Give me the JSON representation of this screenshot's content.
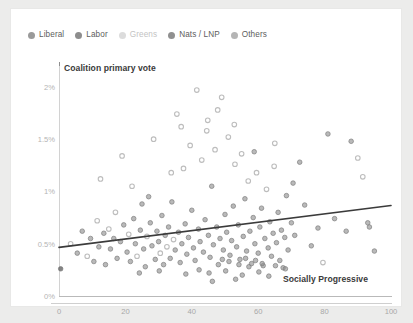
{
  "legend": {
    "items": [
      {
        "label": "Liberal",
        "color": "#9a9a9a",
        "dim": false
      },
      {
        "label": "Labor",
        "color": "#8d8d8d",
        "dim": false
      },
      {
        "label": "Greens",
        "color": "#dcdcdc",
        "dim": true
      },
      {
        "label": "Nats / LNP",
        "color": "#909090",
        "dim": false
      },
      {
        "label": "Others",
        "color": "#b5b5b5",
        "dim": false
      }
    ]
  },
  "chart_data": {
    "type": "scatter",
    "title": "",
    "xlabel": "Socially Progressive",
    "ylabel": "Coalition primary vote",
    "xlim": [
      0,
      100
    ],
    "ylim": [
      0,
      2.2
    ],
    "grid": false,
    "legend_position": "top-left",
    "xticks": [
      0,
      20,
      40,
      60,
      80,
      100
    ],
    "xtick_labels": [
      "0",
      "20",
      "40",
      "60",
      "80",
      "100"
    ],
    "yticks": [
      0,
      0.5,
      1,
      1.5,
      2
    ],
    "ytick_labels": [
      "0%",
      "0.5%",
      "1%",
      "1.5%",
      "2%"
    ],
    "marker_colors": {
      "filled": "#8e8e8e",
      "open": "#bdbdbd",
      "dark": "#6f6f6f"
    },
    "trendline": {
      "label": "linear fit",
      "color": "#3b3b3b",
      "x": [
        0,
        100
      ],
      "y": [
        0.465,
        0.865
      ]
    },
    "points": [
      {
        "x": 0.5,
        "y": 0.26,
        "s": "dark"
      },
      {
        "x": 3.5,
        "y": 0.5,
        "s": "open"
      },
      {
        "x": 5.5,
        "y": 0.41,
        "s": "filled"
      },
      {
        "x": 7.0,
        "y": 0.62,
        "s": "filled"
      },
      {
        "x": 8.5,
        "y": 0.38,
        "s": "open"
      },
      {
        "x": 9.5,
        "y": 0.55,
        "s": "filled"
      },
      {
        "x": 10.5,
        "y": 0.33,
        "s": "filled"
      },
      {
        "x": 11.5,
        "y": 0.72,
        "s": "open"
      },
      {
        "x": 12.0,
        "y": 0.47,
        "s": "filled"
      },
      {
        "x": 12.5,
        "y": 1.12,
        "s": "open"
      },
      {
        "x": 13.5,
        "y": 0.6,
        "s": "filled"
      },
      {
        "x": 14.0,
        "y": 0.3,
        "s": "filled"
      },
      {
        "x": 15.0,
        "y": 0.64,
        "s": "open"
      },
      {
        "x": 15.5,
        "y": 0.45,
        "s": "filled"
      },
      {
        "x": 16.5,
        "y": 0.55,
        "s": "filled"
      },
      {
        "x": 17.0,
        "y": 0.8,
        "s": "open"
      },
      {
        "x": 17.5,
        "y": 0.36,
        "s": "filled"
      },
      {
        "x": 18.5,
        "y": 0.52,
        "s": "filled"
      },
      {
        "x": 19.0,
        "y": 1.34,
        "s": "open"
      },
      {
        "x": 19.5,
        "y": 0.68,
        "s": "filled"
      },
      {
        "x": 20.5,
        "y": 0.42,
        "s": "filled"
      },
      {
        "x": 21.0,
        "y": 0.59,
        "s": "open"
      },
      {
        "x": 21.5,
        "y": 0.33,
        "s": "filled"
      },
      {
        "x": 22.5,
        "y": 0.74,
        "s": "filled"
      },
      {
        "x": 23.0,
        "y": 0.5,
        "s": "filled"
      },
      {
        "x": 23.5,
        "y": 0.38,
        "s": "open"
      },
      {
        "x": 24.5,
        "y": 0.63,
        "s": "filled"
      },
      {
        "x": 25.0,
        "y": 0.88,
        "s": "filled"
      },
      {
        "x": 25.5,
        "y": 0.45,
        "s": "filled"
      },
      {
        "x": 26.0,
        "y": 0.28,
        "s": "filled"
      },
      {
        "x": 26.5,
        "y": 0.57,
        "s": "open"
      },
      {
        "x": 27.5,
        "y": 0.7,
        "s": "filled"
      },
      {
        "x": 28.0,
        "y": 0.48,
        "s": "filled"
      },
      {
        "x": 28.5,
        "y": 1.5,
        "s": "open"
      },
      {
        "x": 29.0,
        "y": 0.35,
        "s": "filled"
      },
      {
        "x": 29.5,
        "y": 0.62,
        "s": "filled"
      },
      {
        "x": 30.0,
        "y": 0.52,
        "s": "filled"
      },
      {
        "x": 30.5,
        "y": 0.41,
        "s": "open"
      },
      {
        "x": 31.0,
        "y": 0.77,
        "s": "filled"
      },
      {
        "x": 31.5,
        "y": 0.3,
        "s": "filled"
      },
      {
        "x": 32.0,
        "y": 0.58,
        "s": "filled"
      },
      {
        "x": 32.5,
        "y": 0.47,
        "s": "open"
      },
      {
        "x": 33.0,
        "y": 0.66,
        "s": "filled"
      },
      {
        "x": 33.5,
        "y": 0.36,
        "s": "filled"
      },
      {
        "x": 34.0,
        "y": 0.9,
        "s": "filled"
      },
      {
        "x": 34.5,
        "y": 0.54,
        "s": "open"
      },
      {
        "x": 35.0,
        "y": 0.44,
        "s": "filled"
      },
      {
        "x": 35.5,
        "y": 1.74,
        "s": "open"
      },
      {
        "x": 36.0,
        "y": 0.61,
        "s": "filled"
      },
      {
        "x": 36.5,
        "y": 0.32,
        "s": "filled"
      },
      {
        "x": 37.0,
        "y": 0.5,
        "s": "filled"
      },
      {
        "x": 37.5,
        "y": 1.22,
        "s": "open"
      },
      {
        "x": 38.0,
        "y": 0.69,
        "s": "filled"
      },
      {
        "x": 38.5,
        "y": 0.4,
        "s": "filled"
      },
      {
        "x": 39.0,
        "y": 0.56,
        "s": "filled"
      },
      {
        "x": 39.5,
        "y": 1.44,
        "s": "open"
      },
      {
        "x": 40.0,
        "y": 0.82,
        "s": "filled"
      },
      {
        "x": 40.5,
        "y": 0.46,
        "s": "filled"
      },
      {
        "x": 41.0,
        "y": 0.34,
        "s": "filled"
      },
      {
        "x": 41.5,
        "y": 1.97,
        "s": "open"
      },
      {
        "x": 42.0,
        "y": 0.64,
        "s": "filled"
      },
      {
        "x": 42.5,
        "y": 0.52,
        "s": "filled"
      },
      {
        "x": 43.0,
        "y": 1.3,
        "s": "open"
      },
      {
        "x": 43.5,
        "y": 0.42,
        "s": "filled"
      },
      {
        "x": 44.0,
        "y": 0.73,
        "s": "filled"
      },
      {
        "x": 44.5,
        "y": 1.58,
        "s": "open"
      },
      {
        "x": 45.0,
        "y": 0.58,
        "s": "filled"
      },
      {
        "x": 45.5,
        "y": 0.37,
        "s": "filled"
      },
      {
        "x": 46.0,
        "y": 1.05,
        "s": "filled"
      },
      {
        "x": 46.5,
        "y": 0.49,
        "s": "filled"
      },
      {
        "x": 47.0,
        "y": 1.4,
        "s": "open"
      },
      {
        "x": 47.5,
        "y": 0.66,
        "s": "filled"
      },
      {
        "x": 48.0,
        "y": 0.3,
        "s": "filled"
      },
      {
        "x": 48.5,
        "y": 0.55,
        "s": "filled"
      },
      {
        "x": 49.0,
        "y": 1.9,
        "s": "open"
      },
      {
        "x": 49.5,
        "y": 0.44,
        "s": "filled"
      },
      {
        "x": 50.0,
        "y": 0.78,
        "s": "filled"
      },
      {
        "x": 50.5,
        "y": 0.61,
        "s": "filled"
      },
      {
        "x": 51.0,
        "y": 1.52,
        "s": "open"
      },
      {
        "x": 51.5,
        "y": 0.39,
        "s": "filled"
      },
      {
        "x": 52.0,
        "y": 0.53,
        "s": "filled"
      },
      {
        "x": 52.5,
        "y": 0.86,
        "s": "filled"
      },
      {
        "x": 53.0,
        "y": 1.26,
        "s": "open"
      },
      {
        "x": 53.5,
        "y": 0.47,
        "s": "filled"
      },
      {
        "x": 54.0,
        "y": 0.68,
        "s": "filled"
      },
      {
        "x": 54.5,
        "y": 0.35,
        "s": "filled"
      },
      {
        "x": 55.0,
        "y": 1.36,
        "s": "open"
      },
      {
        "x": 55.5,
        "y": 0.57,
        "s": "filled"
      },
      {
        "x": 56.0,
        "y": 0.93,
        "s": "filled"
      },
      {
        "x": 56.5,
        "y": 0.43,
        "s": "filled"
      },
      {
        "x": 57.0,
        "y": 1.1,
        "s": "open"
      },
      {
        "x": 57.5,
        "y": 0.62,
        "s": "filled"
      },
      {
        "x": 58.0,
        "y": 0.31,
        "s": "filled"
      },
      {
        "x": 58.5,
        "y": 0.75,
        "s": "filled"
      },
      {
        "x": 59.0,
        "y": 0.5,
        "s": "filled"
      },
      {
        "x": 59.5,
        "y": 1.18,
        "s": "open"
      },
      {
        "x": 60.0,
        "y": 0.41,
        "s": "filled"
      },
      {
        "x": 60.5,
        "y": 0.66,
        "s": "filled"
      },
      {
        "x": 61.0,
        "y": 0.84,
        "s": "filled"
      },
      {
        "x": 61.5,
        "y": 0.29,
        "s": "filled"
      },
      {
        "x": 62.0,
        "y": 0.55,
        "s": "filled"
      },
      {
        "x": 62.5,
        "y": 1.02,
        "s": "open"
      },
      {
        "x": 63.0,
        "y": 0.46,
        "s": "filled"
      },
      {
        "x": 63.5,
        "y": 0.71,
        "s": "filled"
      },
      {
        "x": 64.0,
        "y": 0.38,
        "s": "filled"
      },
      {
        "x": 64.5,
        "y": 0.6,
        "s": "filled"
      },
      {
        "x": 65.0,
        "y": 1.46,
        "s": "open"
      },
      {
        "x": 65.5,
        "y": 0.51,
        "s": "filled"
      },
      {
        "x": 66.0,
        "y": 0.8,
        "s": "filled"
      },
      {
        "x": 66.5,
        "y": 0.34,
        "s": "filled"
      },
      {
        "x": 67.0,
        "y": 0.63,
        "s": "filled"
      },
      {
        "x": 67.5,
        "y": 0.27,
        "s": "filled"
      },
      {
        "x": 68.0,
        "y": 0.56,
        "s": "filled"
      },
      {
        "x": 68.5,
        "y": 0.96,
        "s": "filled"
      },
      {
        "x": 69.0,
        "y": 0.44,
        "s": "filled"
      },
      {
        "x": 70.0,
        "y": 0.7,
        "s": "filled"
      },
      {
        "x": 71.0,
        "y": 0.58,
        "s": "filled"
      },
      {
        "x": 72.5,
        "y": 1.28,
        "s": "filled"
      },
      {
        "x": 74.0,
        "y": 0.87,
        "s": "filled"
      },
      {
        "x": 76.0,
        "y": 0.48,
        "s": "filled"
      },
      {
        "x": 78.0,
        "y": 0.65,
        "s": "filled"
      },
      {
        "x": 79.5,
        "y": 0.32,
        "s": "open"
      },
      {
        "x": 81.0,
        "y": 1.55,
        "s": "filled"
      },
      {
        "x": 83.0,
        "y": 0.74,
        "s": "filled"
      },
      {
        "x": 86.5,
        "y": 0.62,
        "s": "filled"
      },
      {
        "x": 88.0,
        "y": 1.48,
        "s": "filled"
      },
      {
        "x": 90.0,
        "y": 1.32,
        "s": "open"
      },
      {
        "x": 91.5,
        "y": 1.14,
        "s": "open"
      },
      {
        "x": 93.0,
        "y": 0.7,
        "s": "filled"
      },
      {
        "x": 93.5,
        "y": 0.66,
        "s": "filled"
      },
      {
        "x": 95.0,
        "y": 0.43,
        "s": "filled"
      },
      {
        "x": 22.0,
        "y": 1.05,
        "s": "open"
      },
      {
        "x": 27.0,
        "y": 0.95,
        "s": "filled"
      },
      {
        "x": 44.8,
        "y": 1.68,
        "s": "open"
      },
      {
        "x": 52.8,
        "y": 1.64,
        "s": "open"
      },
      {
        "x": 47.8,
        "y": 1.78,
        "s": "open"
      },
      {
        "x": 36.8,
        "y": 1.62,
        "s": "open"
      },
      {
        "x": 33.8,
        "y": 1.18,
        "s": "open"
      },
      {
        "x": 58.8,
        "y": 1.38,
        "s": "filled"
      },
      {
        "x": 64.8,
        "y": 1.24,
        "s": "open"
      },
      {
        "x": 70.5,
        "y": 1.08,
        "s": "filled"
      },
      {
        "x": 45.2,
        "y": 0.22,
        "s": "filled"
      },
      {
        "x": 50.2,
        "y": 0.24,
        "s": "filled"
      },
      {
        "x": 55.2,
        "y": 0.2,
        "s": "filled"
      },
      {
        "x": 60.2,
        "y": 0.23,
        "s": "filled"
      },
      {
        "x": 38.2,
        "y": 0.21,
        "s": "filled"
      },
      {
        "x": 42.2,
        "y": 0.25,
        "s": "filled"
      },
      {
        "x": 30.2,
        "y": 0.24,
        "s": "filled"
      },
      {
        "x": 24.2,
        "y": 0.22,
        "s": "filled"
      },
      {
        "x": 63.2,
        "y": 0.19,
        "s": "filled"
      },
      {
        "x": 68.2,
        "y": 0.26,
        "s": "filled"
      },
      {
        "x": 53.2,
        "y": 0.16,
        "s": "filled"
      },
      {
        "x": 46.2,
        "y": 0.14,
        "s": "filled"
      },
      {
        "x": 57.2,
        "y": 0.28,
        "s": "filled"
      },
      {
        "x": 49.2,
        "y": 0.35,
        "s": "filled"
      },
      {
        "x": 51.2,
        "y": 0.33,
        "s": "filled"
      },
      {
        "x": 54.2,
        "y": 0.3,
        "s": "filled"
      },
      {
        "x": 56.2,
        "y": 0.36,
        "s": "filled"
      },
      {
        "x": 59.2,
        "y": 0.34,
        "s": "filled"
      },
      {
        "x": 61.2,
        "y": 0.31,
        "s": "filled"
      },
      {
        "x": 65.2,
        "y": 0.29,
        "s": "filled"
      }
    ]
  }
}
